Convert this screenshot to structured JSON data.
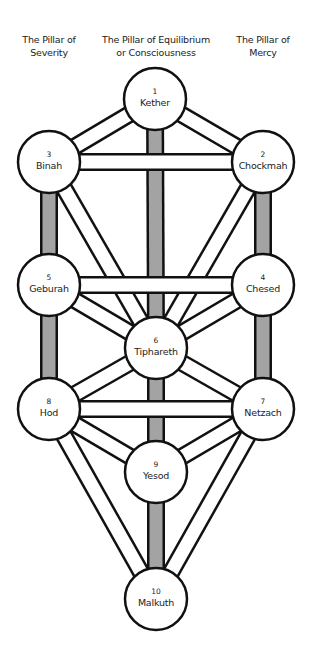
{
  "pillars": [
    {
      "id": "severity",
      "line1": "The Pillar of",
      "line2": "Severity",
      "x": 49
    },
    {
      "id": "equilibrium",
      "line1": "The Pillar of Equilibrium",
      "line2": "or Consciousness",
      "x": 156
    },
    {
      "id": "mercy",
      "line1": "The Pillar of",
      "line2": "Mercy",
      "x": 263
    }
  ],
  "sephiroth": [
    {
      "num": "1",
      "name": "Kether",
      "x": 155,
      "y": 99
    },
    {
      "num": "2",
      "name": "Chockmah",
      "x": 263,
      "y": 162
    },
    {
      "num": "3",
      "name": "Binah",
      "x": 49,
      "y": 162
    },
    {
      "num": "4",
      "name": "Chesed",
      "x": 263,
      "y": 285
    },
    {
      "num": "5",
      "name": "Geburah",
      "x": 49,
      "y": 285
    },
    {
      "num": "6",
      "name": "Tiphareth",
      "x": 156,
      "y": 348
    },
    {
      "num": "7",
      "name": "Netzach",
      "x": 263,
      "y": 409
    },
    {
      "num": "8",
      "name": "Hod",
      "x": 49,
      "y": 409
    },
    {
      "num": "9",
      "name": "Yesod",
      "x": 156,
      "y": 472
    },
    {
      "num": "10",
      "name": "Malkuth",
      "x": 156,
      "y": 599
    }
  ],
  "pillar_paths": [
    [
      1,
      6
    ],
    [
      6,
      9
    ],
    [
      9,
      10
    ],
    [
      3,
      5
    ],
    [
      5,
      8
    ],
    [
      2,
      4
    ],
    [
      4,
      7
    ]
  ],
  "diagonal_paths": [
    [
      1,
      2
    ],
    [
      1,
      3
    ],
    [
      2,
      6
    ],
    [
      3,
      6
    ],
    [
      4,
      6
    ],
    [
      5,
      6
    ],
    [
      6,
      7
    ],
    [
      6,
      8
    ],
    [
      7,
      9
    ],
    [
      8,
      9
    ],
    [
      7,
      10
    ],
    [
      8,
      10
    ]
  ],
  "horizontal_paths": [
    [
      2,
      3
    ],
    [
      4,
      5
    ],
    [
      7,
      8
    ]
  ],
  "style": {
    "pillar_fill": "#a3a3a3",
    "path_fill": "#ffffff",
    "outline": "#111111",
    "circle_radius": 31
  }
}
